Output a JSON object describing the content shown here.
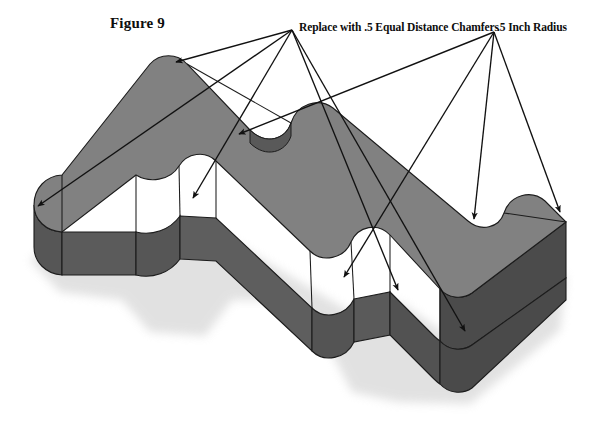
{
  "figure": {
    "title": "Figure 9",
    "type": "isometric-solid-part-drawing"
  },
  "annotations": {
    "chamfer_note": "Replace with .5 Equal Distance Chamfers",
    "radius_note": ".5 Inch Radius"
  },
  "colors": {
    "top_face": "#808080",
    "front_face_left": "#585858",
    "front_face_mid": "#606060",
    "right_face": "#4f4f4f",
    "edge_line": "#1c1c1c",
    "leader_line": "#111111",
    "background": "#ffffff",
    "shadow": "#c8c8c8"
  },
  "geometry": {
    "description": "Extruded L/T-shaped block with rounded convex corners and concave fillet notches",
    "top_face_outline": "M 34,205 C 34,188 46,176 62,175 L 150,64 C 160,54 176,54 186,64 L 252,131 C 268,147 286,139 290,124 C 296,104 316,96 332,106 L 470,222 C 482,232 498,228 502,214 C 508,196 528,190 542,202 L 566,222 L 566,272 L 470,338 C 458,346 442,344 432,334 L 390,292 C 378,280 360,284 354,298 C 346,316 324,320 312,308 L 216,218 C 204,206 186,208 178,220 C 168,236 146,238 134,228 L 48,228 C 40,222 34,214 34,205 Z",
    "leader_origin_left": [
      292,
      30
    ],
    "leader_origin_right": [
      494,
      32
    ],
    "arrow_targets": [
      [
        172,
        64
      ],
      [
        33,
        209
      ],
      [
        235,
        136
      ],
      [
        190,
        200
      ],
      [
        473,
        222
      ],
      [
        395,
        293
      ],
      [
        462,
        333
      ],
      [
        563,
        215
      ]
    ]
  }
}
